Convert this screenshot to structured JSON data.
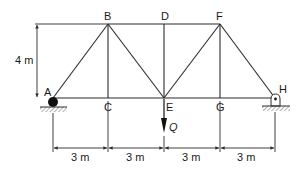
{
  "figure": {
    "type": "truss",
    "colors": {
      "member": "#2a2a2a",
      "dimension": "#2a2a2a",
      "support_fill": "#111111",
      "hatch": "#555555",
      "background": "#ffffff"
    },
    "nodes": {
      "A": {
        "label": "A"
      },
      "B": {
        "label": "B"
      },
      "C": {
        "label": "C"
      },
      "D": {
        "label": "D"
      },
      "E": {
        "label": "E"
      },
      "F": {
        "label": "F"
      },
      "G": {
        "label": "G"
      },
      "H": {
        "label": "H"
      }
    },
    "members": [
      [
        "A",
        "C"
      ],
      [
        "C",
        "E"
      ],
      [
        "E",
        "G"
      ],
      [
        "G",
        "H"
      ],
      [
        "B",
        "D"
      ],
      [
        "D",
        "F"
      ],
      [
        "A",
        "B"
      ],
      [
        "B",
        "C"
      ],
      [
        "B",
        "E"
      ],
      [
        "D",
        "E"
      ],
      [
        "E",
        "F"
      ],
      [
        "F",
        "G"
      ],
      [
        "F",
        "H"
      ]
    ],
    "supports": {
      "A": "roller",
      "H": "pin"
    },
    "load": {
      "node": "E",
      "label": "Q",
      "direction": "down"
    },
    "dimensions": {
      "height": "4 m",
      "spans": [
        "3 m",
        "3 m",
        "3 m",
        "3 m"
      ]
    }
  }
}
